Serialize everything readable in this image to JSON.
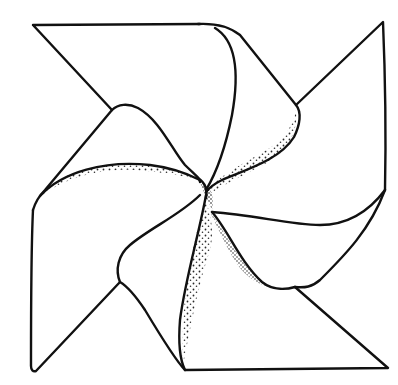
{
  "figure": {
    "style": "black ink outline with stippled shading",
    "colors": {
      "background": "#ffffff",
      "ink": "#111111"
    },
    "parts": [
      {
        "name": "top-left-triangle"
      },
      {
        "name": "top-right-blade"
      },
      {
        "name": "right-triangle"
      },
      {
        "name": "bottom-right-blade"
      },
      {
        "name": "bottom-left-blade"
      },
      {
        "name": "left-blade"
      },
      {
        "name": "center-hub"
      }
    ]
  }
}
